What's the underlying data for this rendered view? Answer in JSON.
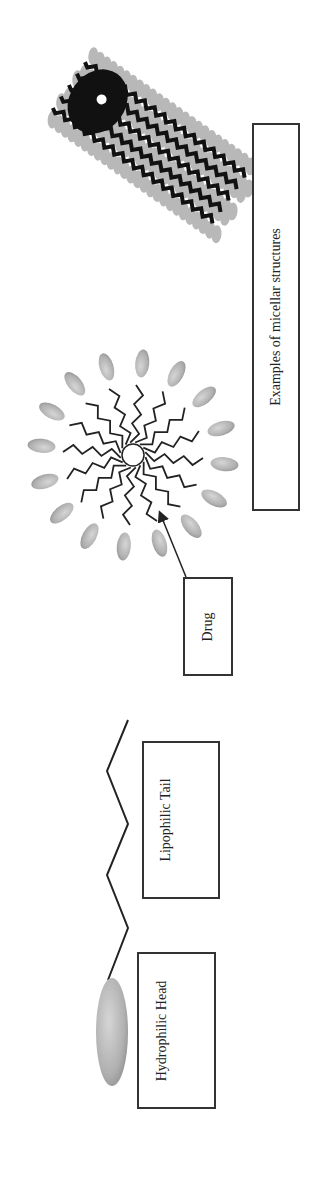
{
  "figure": {
    "orientation": "rotated-90-ccw",
    "labels": {
      "hydrophilic_head": "Hydrophilic Head",
      "lipophilic_tail": "Lipophilic Tail",
      "drug": "Drug",
      "micellar_examples": "Examples of micellar structures"
    },
    "components": [
      {
        "id": "surfactant-monomer",
        "parts": [
          "hydrophilic head (grey ellipse)",
          "lipophilic tail (zigzag line)"
        ]
      },
      {
        "id": "spherical-micelle",
        "description": "16 surfactant monomers radiating around a central drug core",
        "monomer_count": 16
      },
      {
        "id": "cylindrical-micelle",
        "description": "rod-shaped micelle with grey heads outside and dark tails inside"
      }
    ],
    "colors": {
      "head_fill": "#b5b5b5",
      "tail_stroke": "#222222",
      "box_border": "#333333",
      "background": "#ffffff"
    }
  }
}
